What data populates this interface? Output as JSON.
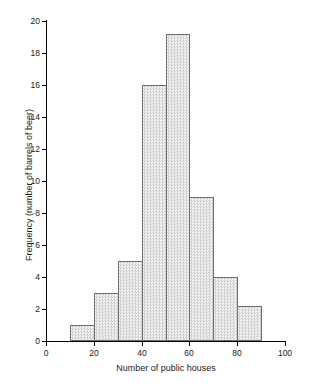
{
  "chart_data": {
    "type": "bar",
    "title": "",
    "subtitle": "",
    "xlabel": "Number of public houses",
    "ylabel": "Frequency (number of barrels of beer)",
    "xlim": [
      0,
      100
    ],
    "ylim": [
      0,
      20
    ],
    "grid": false,
    "legend": null,
    "bin_width": 10,
    "categories": [
      "10-20",
      "20-30",
      "30-40",
      "40-50",
      "50-60",
      "60-70",
      "70-80",
      "80-90"
    ],
    "bin_starts": [
      10,
      20,
      30,
      40,
      50,
      60,
      70,
      80
    ],
    "bin_ends": [
      20,
      30,
      40,
      50,
      60,
      70,
      80,
      90
    ],
    "values": [
      1,
      3,
      5,
      16,
      19.2,
      9,
      4,
      2.2
    ],
    "x_ticks": [
      0,
      20,
      40,
      60,
      80,
      100
    ],
    "x_tick_labels": [
      "0",
      "20",
      "40",
      "60",
      "80",
      "100"
    ],
    "y_ticks": [
      0,
      2,
      4,
      6,
      8,
      10,
      12,
      14,
      16,
      18,
      20
    ],
    "y_tick_labels": [
      "0",
      "2",
      "4",
      "6",
      "8",
      "10",
      "12",
      "14",
      "16",
      "18",
      "20"
    ],
    "bar_fill_color": "#e9e9e9",
    "bar_edge_color": "#6e6e6e",
    "axis_color": "#000000"
  },
  "caption": ""
}
